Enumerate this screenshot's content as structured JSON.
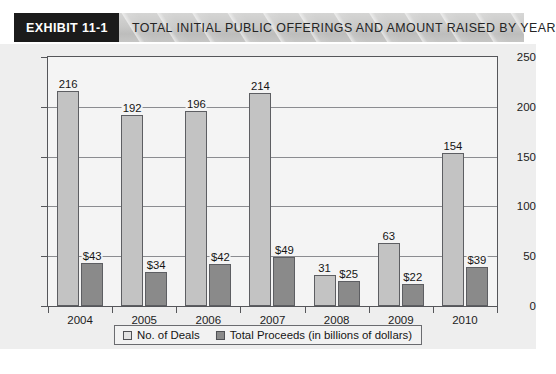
{
  "header": {
    "tag": "EXHIBIT 11-1",
    "title": "TOTAL INITIAL PUBLIC OFFERINGS AND AMOUNT RAISED BY YEAR"
  },
  "source_caption": "",
  "chart_data": {
    "type": "bar",
    "title": "TOTAL INITIAL PUBLIC OFFERINGS AND AMOUNT RAISED BY YEAR",
    "xlabel": "",
    "ylabel": "",
    "ylim": [
      0,
      250
    ],
    "yticks": [
      0,
      50,
      100,
      150,
      200,
      250
    ],
    "grid": true,
    "legend_position": "bottom-center",
    "categories": [
      "2004",
      "2005",
      "2006",
      "2007",
      "2008",
      "2009",
      "2010"
    ],
    "series": [
      {
        "name": "No. of Deals",
        "color": "#c3c3c3",
        "values": [
          216,
          192,
          196,
          214,
          31,
          63,
          154
        ],
        "labels": [
          "216",
          "192",
          "196",
          "214",
          "31",
          "63",
          "154"
        ]
      },
      {
        "name": "Total Proceeds (in billions of dollars)",
        "color": "#8a8a8a",
        "values": [
          43,
          34,
          42,
          49,
          25,
          22,
          39
        ],
        "labels": [
          "$43",
          "$34",
          "$42",
          "$49",
          "$25",
          "$22",
          "$39"
        ]
      }
    ]
  }
}
